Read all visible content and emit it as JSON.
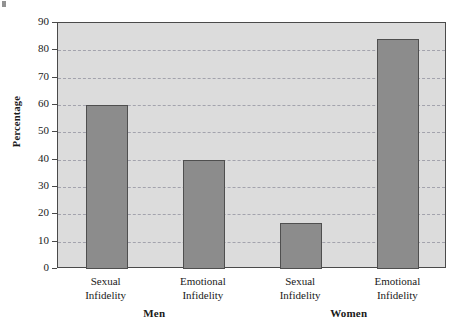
{
  "chart_data": {
    "type": "bar",
    "title": "",
    "xlabel": "",
    "ylabel": "Percentage",
    "ylim": [
      0,
      90
    ],
    "ytick_step": 10,
    "yticks": [
      90,
      80,
      70,
      60,
      50,
      40,
      30,
      20,
      10,
      0
    ],
    "grid": true,
    "legend": "none",
    "categories": [
      "Sexual Infidelity",
      "Emotional Infidelity",
      "Sexual Infidelity",
      "Emotional Infidelity"
    ],
    "category_lines": [
      {
        "line1": "Sexual",
        "line2": "Infidelity"
      },
      {
        "line1": "Emotional",
        "line2": "Infidelity"
      },
      {
        "line1": "Sexual",
        "line2": "Infidelity"
      },
      {
        "line1": "Emotional",
        "line2": "Infidelity"
      }
    ],
    "values": [
      60,
      40,
      17,
      84
    ],
    "groups": [
      {
        "label": "Men",
        "category_indices": [
          0,
          1
        ]
      },
      {
        "label": "Women",
        "category_indices": [
          2,
          3
        ]
      }
    ],
    "colors": {
      "bar_fill": "#8c8c8c",
      "bar_edge": "#4f4f4f",
      "plot_background": "#dcdcdc",
      "axis": "#4a4a4a",
      "gridline": "#9a9aa5",
      "page_background": "#ffffff",
      "text": "#1a1a1a"
    }
  }
}
